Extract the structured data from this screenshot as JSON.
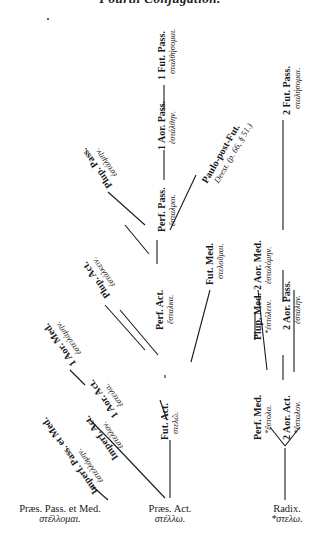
{
  "title": "Fourth Conjugation.",
  "nodes": {
    "praes_pass_med": {
      "label": "Præs. Pass. et Med.",
      "greek": "στέλλομαι."
    },
    "praes_act": {
      "label": "Præs. Act.",
      "greek": "στέλλω."
    },
    "radix": {
      "label": "Radix.",
      "greek": "*στελω."
    },
    "imperf_pass_med": {
      "label": "Imperf. Pass. et Med.",
      "greek": "ἐστελλόμην."
    },
    "imperf_act": {
      "label": "Imperf. Act.",
      "greek": "ἔστελλον."
    },
    "aor1_act": {
      "label": "1 Aor. Act.",
      "greek": "ἔστειλα."
    },
    "aor1_med": {
      "label": "1 Aor. Med.",
      "greek": "ἐστειλάμην."
    },
    "plup_act": {
      "label": "Plup. Act.",
      "greek": "ἐστάλκειν."
    },
    "plup_pass": {
      "label": "Plup. Pass.",
      "greek": "ἐστάλμην."
    },
    "fut_act": {
      "label": "Fut. Act.",
      "greek": "στελῶ."
    },
    "perf_act": {
      "label": "Perf. Act.",
      "greek": "ἔσταλκα."
    },
    "perf_pass": {
      "label": "Perf. Pass.",
      "greek": "ἔσταλμαι."
    },
    "aor1_pass": {
      "label": "1 Aor. Pass.",
      "greek": "ἐστάλθην."
    },
    "fut1_pass": {
      "label": "1 Fut. Pass.",
      "greek": "σταλθήσομαι."
    },
    "paulo_post_fut": {
      "label": "Paulo-post-Fut.",
      "greek": "Deest. (p. 66, § 51.)"
    },
    "fut_med": {
      "label": "Fut. Med.",
      "greek": "στελοῦμαι."
    },
    "perf_med": {
      "label": "Perf. Med.",
      "greek": "*ἔστολα."
    },
    "plup_med": {
      "label": "Plup. Med.",
      "greek": "*ἐστόλειν."
    },
    "aor2_act": {
      "label": "2 Aor. Act.",
      "greek": "*ἔσταλον."
    },
    "aor2_med": {
      "label": "2 Aor. Med.",
      "greek": "ἐσταλόμην."
    },
    "aor2_pass": {
      "label": "2 Aor. Pass.",
      "greek": "ἐστάλην."
    },
    "fut2_pass": {
      "label": "2 Fut. Pass.",
      "greek": "σταλήσομαι."
    }
  }
}
